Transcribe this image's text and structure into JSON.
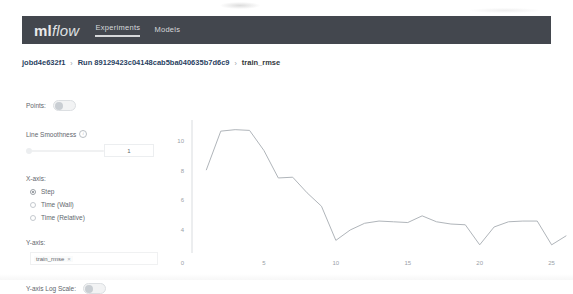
{
  "header": {
    "brand_ml": "ml",
    "brand_flow": "flow",
    "nav": [
      {
        "label": "Experiments",
        "active": true
      },
      {
        "label": "Models",
        "active": false
      }
    ]
  },
  "breadcrumb": {
    "experiment": "jobd4e632f1",
    "separator": "›",
    "run": "Run 89129423c04148cab5ba040635b7d6c9",
    "metric": "train_rmse"
  },
  "controls": {
    "points_label": "Points:",
    "points_toggle_state": "off",
    "smoothness_label": "Line Smoothness",
    "smoothness_info_icon": "info-icon",
    "smoothness_value": "1",
    "x_axis_label": "X-axis:",
    "x_axis_options": [
      {
        "label": "Step",
        "selected": true
      },
      {
        "label": "Time (Wall)",
        "selected": false
      },
      {
        "label": "Time (Relative)",
        "selected": false
      }
    ],
    "y_axis_label": "Y-axis:",
    "y_axis_metric": "train_rmse",
    "y_axis_metric_remove": "×",
    "log_scale_label": "Y-axis Log Scale:",
    "log_scale_toggle_state": "off"
  },
  "chart_data": {
    "type": "line",
    "title": "",
    "xlabel": "",
    "ylabel": "",
    "series": [
      {
        "name": "train_rmse",
        "color": "#b0b5ba",
        "x": [
          1,
          2,
          3,
          4,
          5,
          6,
          7,
          8,
          9,
          10,
          11,
          12,
          13,
          14,
          15,
          16,
          17,
          18,
          19,
          20,
          21,
          22,
          23,
          24,
          25,
          26
        ],
        "values": [
          8.05,
          10.65,
          10.75,
          10.7,
          9.35,
          7.5,
          7.55,
          6.5,
          5.6,
          3.3,
          4.0,
          4.45,
          4.6,
          4.55,
          4.5,
          4.95,
          4.55,
          4.4,
          4.35,
          3.0,
          4.2,
          4.55,
          4.6,
          4.6,
          3.0,
          3.6
        ]
      }
    ],
    "xticks": [
      0,
      5,
      10,
      15,
      20,
      25
    ],
    "yticks": [
      4,
      6,
      8,
      10
    ],
    "y_origin_label": "0",
    "xlim": [
      0,
      26
    ],
    "ylim": [
      2.45,
      11.4
    ],
    "grid": false,
    "legend": "none"
  }
}
